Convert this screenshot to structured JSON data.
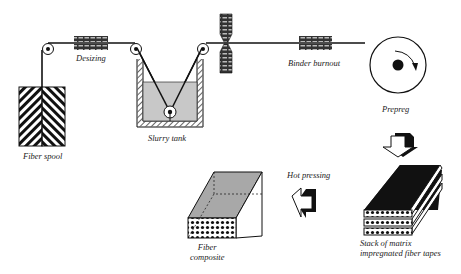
{
  "labels": {
    "desizing": "Desizing",
    "binder_burnout": "Binder burnout",
    "fiber_spool": "Fiber spool",
    "slurry_tank": "Slurry tank",
    "prepreg": "Prepreg",
    "hot_pressing": "Hot pressing",
    "fiber_composite_1": "Fiber",
    "fiber_composite_2": "composite",
    "stack_1": "Stack of matrix",
    "stack_2": "impregnated fiber tapes"
  },
  "colors": {
    "line": "#111111",
    "slurry": "#c8c8c8",
    "top_gray": "#a8a8a8",
    "dark": "#1a1a1a"
  }
}
